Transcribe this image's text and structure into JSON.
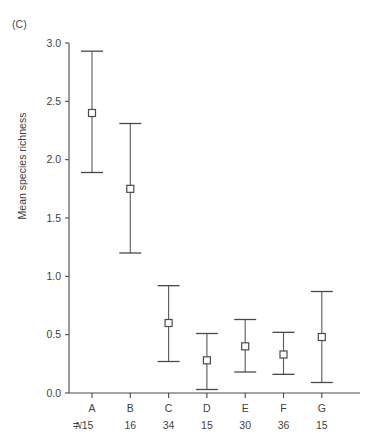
{
  "panel": {
    "label": "(C)"
  },
  "axes": {
    "ylabel": "Mean species richness",
    "ytick_labels": [
      "0.0",
      "0.5",
      "1.0",
      "1.5",
      "2.0",
      "2.5",
      "3.0"
    ],
    "n_prefix": "N",
    "n_equals": "= "
  },
  "chart_data": {
    "type": "scatter",
    "title": "(C)",
    "xlabel": "",
    "ylabel": "Mean species richness",
    "ylim": [
      0.0,
      3.0
    ],
    "yticks": [
      0.0,
      0.5,
      1.0,
      1.5,
      2.0,
      2.5,
      3.0
    ],
    "grid": false,
    "legend": "none",
    "error_bar_style": "vertical line with horizontal caps, open square mean marker",
    "categories": [
      "A",
      "B",
      "C",
      "D",
      "E",
      "F",
      "G"
    ],
    "sample_sizes": [
      15,
      16,
      34,
      15,
      30,
      36,
      15
    ],
    "sample_size_labels": [
      "N = 15",
      "16",
      "34",
      "15",
      "30",
      "36",
      "15"
    ],
    "values": [
      2.4,
      1.75,
      0.6,
      0.28,
      0.4,
      0.33,
      0.48
    ],
    "error_upper": [
      2.93,
      2.31,
      0.92,
      0.51,
      0.63,
      0.52,
      0.87
    ],
    "error_lower": [
      1.89,
      1.2,
      0.27,
      0.03,
      0.18,
      0.16,
      0.09
    ],
    "points": [
      {
        "category": "A",
        "n": 15,
        "mean": 2.4,
        "ci_low": 1.89,
        "ci_high": 2.93
      },
      {
        "category": "B",
        "n": 16,
        "mean": 1.75,
        "ci_low": 1.2,
        "ci_high": 2.31
      },
      {
        "category": "C",
        "n": 34,
        "mean": 0.6,
        "ci_low": 0.27,
        "ci_high": 0.92
      },
      {
        "category": "D",
        "n": 15,
        "mean": 0.28,
        "ci_low": 0.03,
        "ci_high": 0.51
      },
      {
        "category": "E",
        "n": 30,
        "mean": 0.4,
        "ci_low": 0.18,
        "ci_high": 0.63
      },
      {
        "category": "F",
        "n": 36,
        "mean": 0.33,
        "ci_low": 0.16,
        "ci_high": 0.52
      },
      {
        "category": "G",
        "n": 15,
        "mean": 0.48,
        "ci_low": 0.09,
        "ci_high": 0.87
      }
    ]
  },
  "colors": {
    "background": "#ffffff",
    "axis": "#4a4a4a",
    "marker_fill": "#ffffff",
    "marker_stroke": "#4a4a4a",
    "error_bar": "#5a5a5a",
    "text": "#3f3f3f"
  }
}
